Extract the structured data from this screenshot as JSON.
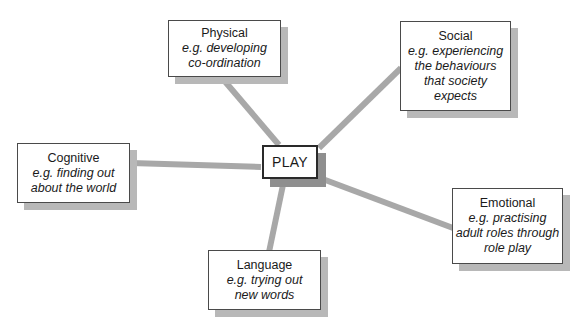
{
  "diagram": {
    "type": "mind-map",
    "center": {
      "id": "play",
      "label": "PLAY"
    },
    "colors": {
      "background": "#ffffff",
      "box_fill": "#ffffff",
      "box_border": "#4a4a4a",
      "center_border": "#2a2a2a",
      "shadow": "#b8b8b8",
      "center_shadow": "#8f8f8f",
      "connector": "#a8a8a8",
      "text": "#1a1a1a"
    },
    "branches": [
      {
        "id": "physical",
        "title": "Physical",
        "detail_lines": [
          "e.g. developing",
          "co-ordination"
        ]
      },
      {
        "id": "social",
        "title": "Social",
        "detail_lines": [
          "e.g. experiencing",
          "the behaviours",
          "that society",
          "expects"
        ]
      },
      {
        "id": "cognitive",
        "title": "Cognitive",
        "detail_lines": [
          "e.g. finding out",
          "about the world"
        ]
      },
      {
        "id": "emotional",
        "title": "Emotional",
        "detail_lines": [
          "e.g. practising",
          "adult roles through",
          "role play"
        ]
      },
      {
        "id": "language",
        "title": "Language",
        "detail_lines": [
          "e.g. trying out",
          "new words"
        ]
      }
    ],
    "connectors": [
      {
        "from": "play",
        "to": "physical"
      },
      {
        "from": "play",
        "to": "social"
      },
      {
        "from": "play",
        "to": "cognitive"
      },
      {
        "from": "play",
        "to": "emotional"
      },
      {
        "from": "play",
        "to": "language"
      }
    ]
  }
}
